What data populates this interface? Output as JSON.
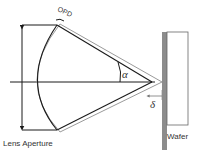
{
  "diagram": {
    "labels": {
      "opd": "OPD",
      "alpha": "α",
      "delta": "δ",
      "lens_aperture": "Lens Aperture",
      "wafer": "Wafer"
    },
    "colors": {
      "primary_line": "#1a1a1a",
      "secondary_line": "#9a9a9a",
      "wafer_edge": "#8c8c8c",
      "wafer_body": "#ffffff",
      "text": "#333333"
    }
  }
}
